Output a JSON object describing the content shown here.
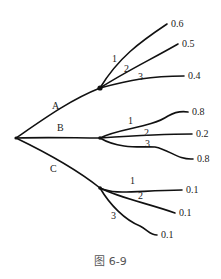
{
  "diagram": {
    "type": "tree",
    "root": {
      "x": 16,
      "y": 138
    },
    "branches": [
      {
        "label": "A",
        "label_pos": [
          52,
          109
        ],
        "node": {
          "x": 100,
          "y": 88
        },
        "path": "M16,138 C45,118 70,100 100,88",
        "children": [
          {
            "label": "1",
            "label_pos": [
              112,
              62
            ],
            "value": "0.6",
            "value_pos": [
              171,
              27
            ],
            "path": "M100,88 C118,58 140,42 167,24"
          },
          {
            "label": "2",
            "label_pos": [
              124,
              72
            ],
            "value": "0.5",
            "value_pos": [
              182,
              47
            ],
            "path": "M100,88 C125,72 150,60 178,44"
          },
          {
            "label": "3",
            "label_pos": [
              138,
              80
            ],
            "value": "0.4",
            "value_pos": [
              188,
              79
            ],
            "path": "M100,88 C130,80 150,76 184,76"
          }
        ]
      },
      {
        "label": "B",
        "label_pos": [
          57,
          131
        ],
        "node": {
          "x": 100,
          "y": 138
        },
        "path": "M16,138 C50,137 75,138 100,138",
        "children": [
          {
            "label": "1",
            "label_pos": [
              128,
              124
            ],
            "value": "0.8",
            "value_pos": [
              192,
              115
            ],
            "path": "M100,138 C120,128 150,128 168,116 C175,112 182,111 188,112"
          },
          {
            "label": "2",
            "label_pos": [
              144,
              136
            ],
            "value": "0.2",
            "value_pos": [
              196,
              137
            ],
            "path": "M100,138 C130,136 160,134 192,134"
          },
          {
            "label": "3",
            "label_pos": [
              145,
              147
            ],
            "value": "0.8",
            "value_pos": [
              197,
              162
            ],
            "path": "M100,138 C120,150 145,146 155,147 C170,150 178,160 193,159"
          }
        ]
      },
      {
        "label": "C",
        "label_pos": [
          50,
          172
        ],
        "node": {
          "x": 100,
          "y": 188
        },
        "path": "M16,138 C45,152 75,168 100,188",
        "children": [
          {
            "label": "1",
            "label_pos": [
              130,
              184
            ],
            "value": "0.1",
            "value_pos": [
              186,
              193
            ],
            "path": "M100,188 C115,195 130,191 182,190"
          },
          {
            "label": "2",
            "label_pos": [
              138,
              199
            ],
            "value": "0.1",
            "value_pos": [
              179,
              216
            ],
            "path": "M100,188 C120,198 150,204 175,213"
          },
          {
            "label": "3",
            "label_pos": [
              111,
              219
            ],
            "value": "0.1",
            "value_pos": [
              161,
              238
            ],
            "path": "M100,188 C110,205 125,220 140,226 C148,230 150,235 157,235"
          }
        ]
      }
    ]
  },
  "caption": "图 6-9"
}
